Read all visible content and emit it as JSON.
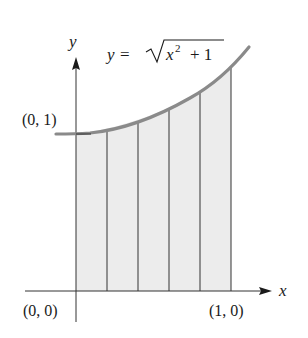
{
  "figure": {
    "equation": {
      "lhs": "y",
      "equals": "=",
      "radicand_base": "x",
      "exponent": "2",
      "radicand_rest": "+ 1",
      "full_text": "y = √(x² + 1)"
    },
    "axes": {
      "x_label": "x",
      "y_label": "y"
    },
    "points": {
      "p01": "(0, 1)",
      "p00": "(0, 0)",
      "p10": "(1, 0)"
    },
    "function": "sqrt(x^2 + 1)",
    "interval": [
      0,
      1
    ],
    "subintervals": 5,
    "partition": [
      0,
      0.2,
      0.4,
      0.6,
      0.8,
      1.0
    ],
    "colors": {
      "curve": "#8a8a8a",
      "shade": "#ececec",
      "lines": "#333333",
      "text": "#1a1a1a"
    }
  }
}
